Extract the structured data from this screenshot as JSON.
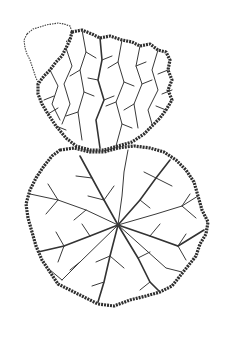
{
  "figure": {
    "colors": {
      "background": "#ffffff",
      "ink": "#333333"
    },
    "landmasses": [
      {
        "name": "upper-lobe",
        "center": [
          100,
          95
        ]
      },
      {
        "name": "lower-lobe",
        "center": [
          118,
          225
        ]
      }
    ],
    "partial_region": {
      "name": "upper-left-sparse-lobe",
      "center": [
        42,
        45
      ]
    }
  }
}
